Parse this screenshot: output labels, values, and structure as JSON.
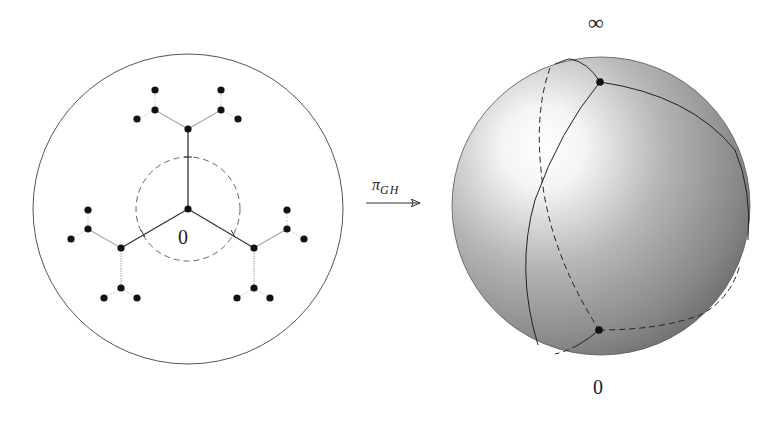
{
  "figure": {
    "left_panel": {
      "title": "Tree embedded in the unit disk",
      "disk": {
        "cx": 188,
        "cy": 209,
        "r": 155,
        "stroke": "#555555"
      },
      "dashed_circle": {
        "cx": 188,
        "cy": 209,
        "r": 52,
        "stroke": "#666666"
      },
      "origin_label": "0",
      "root_node": {
        "x": 188,
        "y": 209
      },
      "branches": [
        {
          "name": "top",
          "node": {
            "x": 188,
            "y": 129
          },
          "children": [
            {
              "x": 155,
              "y": 110,
              "leaves": [
                {
                  "x": 155,
                  "y": 90
                },
                {
                  "x": 137,
                  "y": 119
                }
              ]
            },
            {
              "x": 221,
              "y": 110,
              "leaves": [
                {
                  "x": 221,
                  "y": 90
                },
                {
                  "x": 238,
                  "y": 119
                }
              ]
            }
          ]
        },
        {
          "name": "left",
          "node": {
            "x": 121,
            "y": 248
          },
          "children": [
            {
              "x": 88,
              "y": 229,
              "leaves": [
                {
                  "x": 88,
                  "y": 210
                },
                {
                  "x": 71,
                  "y": 239
                }
              ]
            },
            {
              "x": 121,
              "y": 288,
              "leaves": [
                {
                  "x": 104,
                  "y": 298
                },
                {
                  "x": 137,
                  "y": 298
                }
              ]
            }
          ]
        },
        {
          "name": "right",
          "node": {
            "x": 254,
            "y": 248
          },
          "children": [
            {
              "x": 287,
              "y": 229,
              "leaves": [
                {
                  "x": 287,
                  "y": 210
                },
                {
                  "x": 304,
                  "y": 239
                }
              ]
            },
            {
              "x": 254,
              "y": 288,
              "leaves": [
                {
                  "x": 237,
                  "y": 298
                },
                {
                  "x": 270,
                  "y": 298
                }
              ]
            }
          ]
        }
      ]
    },
    "arrow": {
      "label_main": "π",
      "label_sub": "GH",
      "x1": 366,
      "y1": 203,
      "x2": 420,
      "y2": 203
    },
    "right_panel": {
      "title": "Riemann sphere",
      "sphere": {
        "cx": 601,
        "cy": 206,
        "r": 149
      },
      "top_label": "∞",
      "bottom_label": "0",
      "point_infinity": {
        "x": 600,
        "y": 82
      },
      "point_zero": {
        "x": 599,
        "y": 330
      },
      "colors": {
        "highlight": "#ffffff",
        "mid": "#b8b8b8",
        "shadow": "#6e6e6e",
        "lines": "#222222"
      }
    }
  }
}
